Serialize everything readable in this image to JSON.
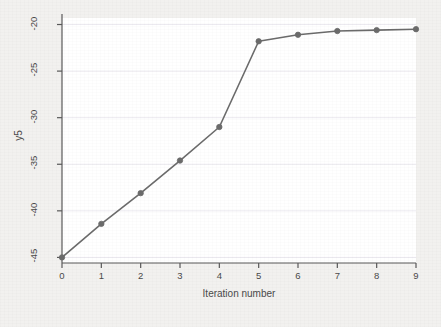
{
  "figure": {
    "background_color": "#f2f1ef",
    "plot_background_color": "#ffffff",
    "axis_color": "#595959",
    "gridline_color": "#eceaf0",
    "series_color": "#6b6b6b",
    "marker_color": "#6b6b6b",
    "tick_text_color": "#4a4a4a"
  },
  "chart_data": {
    "type": "line",
    "title": "",
    "xlabel": "Iteration number",
    "ylabel": "y5",
    "x": [
      0,
      1,
      2,
      3,
      4,
      5,
      6,
      7,
      8,
      9
    ],
    "values": [
      -45.0,
      -41.4,
      -38.1,
      -34.6,
      -31.0,
      -21.8,
      -21.1,
      -20.7,
      -20.6,
      -20.5
    ],
    "xticks": [
      0,
      1,
      2,
      3,
      4,
      5,
      6,
      7,
      8,
      9
    ],
    "xtick_labels": [
      "0",
      "1",
      "2",
      "3",
      "4",
      "5",
      "6",
      "7",
      "8",
      "9"
    ],
    "yticks": [
      -45,
      -40,
      -35,
      -30,
      -25,
      -20
    ],
    "ytick_labels": [
      "-45",
      "-40",
      "-35",
      "-30",
      "-25",
      "-20"
    ],
    "xlim": [
      0,
      9
    ],
    "ylim": [
      -45.6,
      -19.3
    ],
    "grid": "horizontal",
    "legend": "none",
    "marker": "circle",
    "line_style": "solid"
  }
}
